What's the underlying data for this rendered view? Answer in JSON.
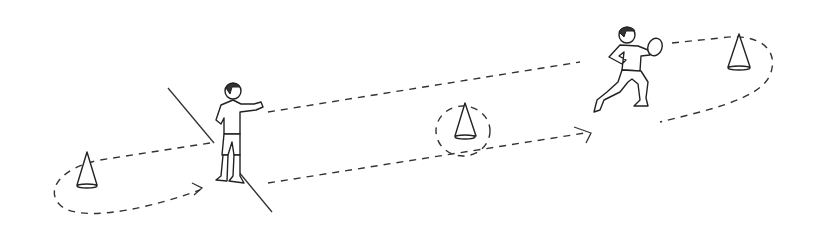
{
  "diagram": {
    "type": "sports-drill-illustration",
    "background": "#ffffff",
    "ink_color": "#222222",
    "elements": {
      "cones": [
        {
          "id": "cone-left",
          "x": 87,
          "y": 157
        },
        {
          "id": "cone-middle-circled",
          "x": 465,
          "y": 123
        },
        {
          "id": "cone-right",
          "x": 739,
          "y": 50
        }
      ],
      "players": [
        {
          "id": "player-standing",
          "pose": "standing, arm extended",
          "x": 228,
          "y": 130
        },
        {
          "id": "player-running-with-ball",
          "pose": "running, carrying ball",
          "x": 628,
          "y": 75
        }
      ],
      "start_line": {
        "from": [
          168,
          88
        ],
        "to": [
          272,
          212
        ]
      },
      "path": {
        "style": "dashed",
        "arrows": 2
      }
    }
  }
}
